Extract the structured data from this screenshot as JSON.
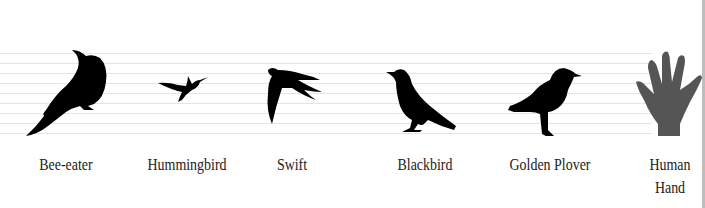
{
  "diagram": {
    "type": "size-comparison",
    "guide_lines": 9,
    "colors": {
      "silhouette": "#000000",
      "hand": "#555555",
      "lines": "#e4e4e4",
      "edge": "#bdbdbd"
    },
    "items": [
      {
        "label": "Bee-eater",
        "icon": "bee-eater-silhouette-icon"
      },
      {
        "label": "Hummingbird",
        "icon": "hummingbird-silhouette-icon"
      },
      {
        "label": "Swift",
        "icon": "swift-silhouette-icon"
      },
      {
        "label": "Blackbird",
        "icon": "blackbird-silhouette-icon"
      },
      {
        "label": "Golden Plover",
        "icon": "golden-plover-silhouette-icon"
      },
      {
        "label": "Human",
        "label2": "Hand",
        "icon": "human-hand-silhouette-icon"
      }
    ]
  }
}
